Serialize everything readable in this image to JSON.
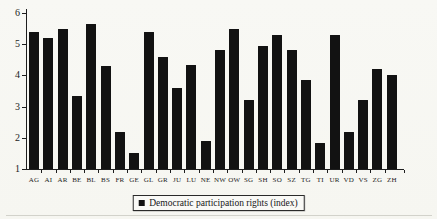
{
  "figure": {
    "background": "#f7f7f3",
    "bar_color": "#121212",
    "axis_color": "#1e1e1e",
    "text_color": "#1c1c1c"
  },
  "chart_data": {
    "type": "bar",
    "title": "",
    "xlabel": "",
    "ylabel": "",
    "categories": [
      "AG",
      "AI",
      "AR",
      "BE",
      "BL",
      "BS",
      "FR",
      "GE",
      "GL",
      "GR",
      "JU",
      "LU",
      "NE",
      "NW",
      "OW",
      "SG",
      "SH",
      "SO",
      "SZ",
      "TG",
      "TI",
      "UR",
      "VD",
      "VS",
      "ZG",
      "ZH"
    ],
    "values": [
      5.4,
      5.2,
      5.5,
      3.35,
      5.65,
      4.3,
      2.2,
      1.5,
      5.4,
      4.6,
      3.6,
      4.35,
      1.9,
      4.8,
      5.5,
      3.2,
      4.95,
      5.3,
      4.8,
      3.85,
      1.85,
      5.3,
      2.2,
      3.2,
      4.2,
      4.0
    ],
    "ylim": [
      1,
      6
    ],
    "yticks": [
      1,
      2,
      3,
      4,
      5,
      6
    ],
    "grid": false,
    "bar_color": "#121212",
    "legend": {
      "position": "bottom-center",
      "entries": [
        {
          "marker": "filled-square",
          "color": "#121212",
          "label": "Democratic participation rights (index)"
        }
      ]
    }
  }
}
